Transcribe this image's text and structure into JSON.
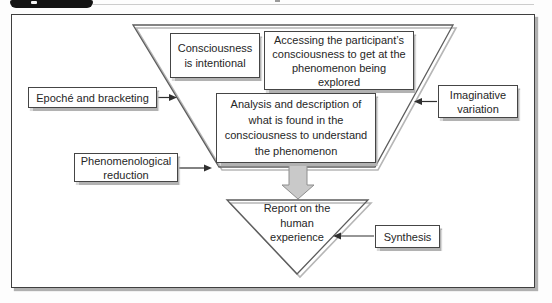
{
  "labels": {
    "epoche": "Epoché and bracketing",
    "phenomenological_reduction": "Phenomenological\nreduction",
    "imaginative_variation": "Imaginative\nvariation",
    "synthesis": "Synthesis",
    "consciousness": "Consciousness\nis intentional",
    "accessing": "Accessing the participant’s\nconsciousness to get at the\nphenomenon being\nexplored",
    "analysis": "Analysis and description of\nwhat is found in the\nconsciousness to understand\nthe phenomenon",
    "report": "Report on the\nhuman\nexperience"
  },
  "colors": {
    "frame_border": "#3f3f3f",
    "box_border": "#454545",
    "box_shadow": "#b2b2b2",
    "funnel_stroke": "#5c5c5c",
    "funnel_shadow": "#b6b6b6",
    "thin_arrow": "#2f2f2f",
    "block_arrow_fill": "#c9c9c9",
    "block_arrow_stroke": "#8e8e8e",
    "tab_background": "#141414",
    "text": "#262626"
  }
}
